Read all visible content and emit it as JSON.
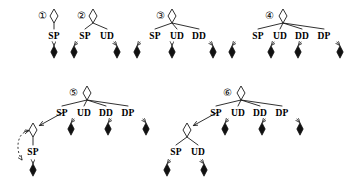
{
  "figure": {
    "title": "",
    "background_color": "#ffffff",
    "stroke_color": "#1a1a1a",
    "node_open_fill": "#ffffff",
    "node_leaf_fill": "#111111"
  },
  "glyphs": {
    "circled_1": "①",
    "circled_2": "②",
    "circled_3": "③",
    "circled_4": "④",
    "circled_5": "⑤",
    "circled_6": "⑥"
  },
  "trees": [
    {
      "id": "tree-1",
      "number": "①",
      "number_x": 42,
      "number_y": 16,
      "root": {
        "x": 54,
        "y": 16
      },
      "branches": [
        {
          "label": "SP",
          "label_x": 54,
          "label_y": 36,
          "leaf_x": 54,
          "leaf_y": 52,
          "edge_style": "solid",
          "arrow": "down"
        }
      ],
      "subtree": null
    },
    {
      "id": "tree-2",
      "number": "②",
      "number_x": 81,
      "number_y": 16,
      "root": {
        "x": 93,
        "y": 16
      },
      "branches": [
        {
          "label": "SP",
          "label_x": 85,
          "label_y": 36,
          "leaf_x": 74,
          "leaf_y": 52,
          "edge_style": "solid",
          "arrow": "down-left"
        },
        {
          "label": "UD",
          "label_x": 107,
          "label_y": 36,
          "leaf_x": 117,
          "leaf_y": 52,
          "edge_style": "solid",
          "arrow": "down-right"
        }
      ],
      "subtree": null
    },
    {
      "id": "tree-3",
      "number": "③",
      "number_x": 160,
      "number_y": 16,
      "root": {
        "x": 172,
        "y": 16
      },
      "branches": [
        {
          "label": "SP",
          "label_x": 155,
          "label_y": 36,
          "leaf_x": 137,
          "leaf_y": 52,
          "edge_style": "solid",
          "arrow": "down-left"
        },
        {
          "label": "UD",
          "label_x": 177,
          "label_y": 36,
          "leaf_x": 172,
          "leaf_y": 52,
          "edge_style": "solid",
          "arrow": "down"
        },
        {
          "label": "DD",
          "label_x": 199,
          "label_y": 36,
          "leaf_x": 213,
          "leaf_y": 52,
          "edge_style": "solid",
          "arrow": "down-right"
        }
      ],
      "subtree": null
    },
    {
      "id": "tree-4",
      "number": "④",
      "number_x": 269,
      "number_y": 16,
      "root": {
        "x": 283,
        "y": 16
      },
      "branches": [
        {
          "label": "SP",
          "label_x": 258,
          "label_y": 36,
          "leaf_x": 232,
          "leaf_y": 52,
          "edge_style": "solid",
          "arrow": "down-left"
        },
        {
          "label": "UD",
          "label_x": 280,
          "label_y": 36,
          "leaf_x": 271,
          "leaf_y": 52,
          "edge_style": "solid",
          "arrow": "down-left"
        },
        {
          "label": "DD",
          "label_x": 302,
          "label_y": 36,
          "leaf_x": 298,
          "leaf_y": 52,
          "edge_style": "solid",
          "arrow": "down-left"
        },
        {
          "label": "DP",
          "label_x": 324,
          "label_y": 36,
          "leaf_x": 340,
          "leaf_y": 52,
          "edge_style": "solid",
          "arrow": "down-right"
        }
      ],
      "subtree": null
    },
    {
      "id": "tree-5",
      "number": "⑤",
      "number_x": 73,
      "number_y": 93,
      "root": {
        "x": 87,
        "y": 93
      },
      "branches": [
        {
          "label": "SP",
          "label_x": 62,
          "label_y": 113,
          "leaf_x": null,
          "leaf_y": null,
          "edge_style": "solid",
          "arrow": "down-left"
        },
        {
          "label": "UD",
          "label_x": 84,
          "label_y": 113,
          "leaf_x": 71,
          "leaf_y": 129,
          "edge_style": "solid",
          "arrow": "down-left"
        },
        {
          "label": "DD",
          "label_x": 106,
          "label_y": 113,
          "leaf_x": 108,
          "leaf_y": 129,
          "edge_style": "solid",
          "arrow": "down-left"
        },
        {
          "label": "DP",
          "label_x": 128,
          "label_y": 113,
          "leaf_x": 146,
          "leaf_y": 129,
          "edge_style": "solid",
          "arrow": "down-right"
        }
      ],
      "subtree": {
        "id": "tree-5-sub",
        "root": {
          "x": 33,
          "y": 130
        },
        "incoming_arrow_from": {
          "x": 52,
          "y": 120
        },
        "branches": [
          {
            "label": "SP",
            "label_x": 33,
            "label_y": 152,
            "leaf_x": 33,
            "leaf_y": 170,
            "edge_style": "solid",
            "arrow": "down"
          }
        ],
        "dashed_loop": true
      }
    },
    {
      "id": "tree-6",
      "number": "⑥",
      "number_x": 227,
      "number_y": 93,
      "root": {
        "x": 241,
        "y": 93
      },
      "branches": [
        {
          "label": "SP",
          "label_x": 216,
          "label_y": 113,
          "leaf_x": null,
          "leaf_y": null,
          "edge_style": "solid",
          "arrow": "down-left"
        },
        {
          "label": "UD",
          "label_x": 238,
          "label_y": 113,
          "leaf_x": 225,
          "leaf_y": 129,
          "edge_style": "solid",
          "arrow": "down-left"
        },
        {
          "label": "DD",
          "label_x": 260,
          "label_y": 113,
          "leaf_x": 262,
          "leaf_y": 129,
          "edge_style": "solid",
          "arrow": "down-left"
        },
        {
          "label": "DP",
          "label_x": 282,
          "label_y": 113,
          "leaf_x": 300,
          "leaf_y": 129,
          "edge_style": "solid",
          "arrow": "down-right"
        }
      ],
      "subtree": {
        "id": "tree-6-sub",
        "root": {
          "x": 187,
          "y": 130
        },
        "incoming_arrow_from": {
          "x": 206,
          "y": 120
        },
        "branches": [
          {
            "label": "SP",
            "label_x": 176,
            "label_y": 152,
            "leaf_x": 167,
            "leaf_y": 170,
            "edge_style": "solid",
            "arrow": "down-left"
          },
          {
            "label": "UD",
            "label_x": 198,
            "label_y": 152,
            "leaf_x": 204,
            "leaf_y": 170,
            "edge_style": "solid",
            "arrow": "down-right"
          }
        ],
        "dashed_loop": false
      }
    }
  ]
}
